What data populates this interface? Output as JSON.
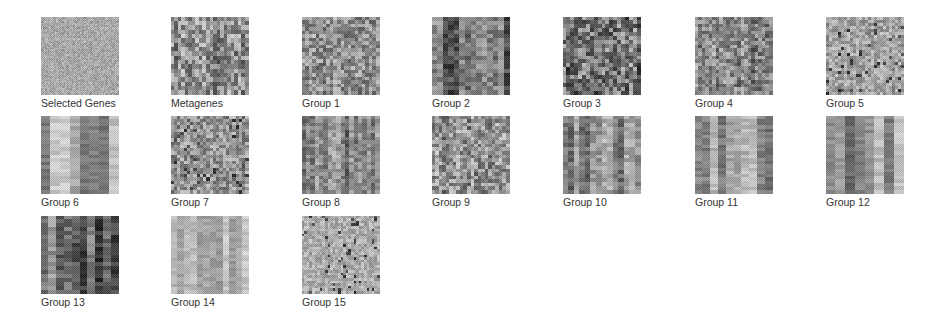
{
  "figure": {
    "title": "",
    "background": "#ffffff",
    "label_color": "#333333"
  },
  "chart_data": {
    "type": "heatmap",
    "title": "",
    "layout": {
      "rows": 3,
      "columns": 7,
      "panel_size_px": 78
    },
    "colormap": "grayscale",
    "panels": [
      {
        "name": "Selected Genes",
        "row": 0,
        "col": 0,
        "style": "fine-noise",
        "cells": [
          64,
          64
        ],
        "mean": 0.66,
        "contrast": 0.1,
        "bar_strength": 0.0
      },
      {
        "name": "Metagenes",
        "row": 0,
        "col": 1,
        "style": "blocky",
        "cells": [
          18,
          22
        ],
        "mean": 0.55,
        "contrast": 0.32,
        "bar_strength": 0.3
      },
      {
        "name": "Group 1",
        "row": 0,
        "col": 2,
        "style": "blocky",
        "cells": [
          22,
          22
        ],
        "mean": 0.56,
        "contrast": 0.25,
        "bar_strength": 0.15
      },
      {
        "name": "Group 2",
        "row": 0,
        "col": 3,
        "style": "blocky-bars",
        "cells": [
          18,
          14
        ],
        "mean": 0.45,
        "contrast": 0.32,
        "bar_strength": 0.5
      },
      {
        "name": "Group 3",
        "row": 0,
        "col": 4,
        "style": "blocky",
        "cells": [
          20,
          20
        ],
        "mean": 0.45,
        "contrast": 0.34,
        "bar_strength": 0.2
      },
      {
        "name": "Group 4",
        "row": 0,
        "col": 5,
        "style": "blocky",
        "cells": [
          22,
          22
        ],
        "mean": 0.52,
        "contrast": 0.28,
        "bar_strength": 0.3
      },
      {
        "name": "Group 5",
        "row": 0,
        "col": 6,
        "style": "speckled",
        "cells": [
          26,
          26
        ],
        "mean": 0.64,
        "contrast": 0.18,
        "bar_strength": 0.15
      },
      {
        "name": "Group 6",
        "row": 1,
        "col": 0,
        "style": "vertical-bars",
        "cells": [
          22,
          8
        ],
        "mean": 0.62,
        "contrast": 0.25,
        "bar_strength": 0.7
      },
      {
        "name": "Group 7",
        "row": 1,
        "col": 1,
        "style": "speckled",
        "cells": [
          24,
          24
        ],
        "mean": 0.58,
        "contrast": 0.22,
        "bar_strength": 0.1
      },
      {
        "name": "Group 8",
        "row": 1,
        "col": 2,
        "style": "blocky-bars",
        "cells": [
          22,
          18
        ],
        "mean": 0.52,
        "contrast": 0.28,
        "bar_strength": 0.5
      },
      {
        "name": "Group 9",
        "row": 1,
        "col": 3,
        "style": "blocky",
        "cells": [
          22,
          22
        ],
        "mean": 0.58,
        "contrast": 0.28,
        "bar_strength": 0.2
      },
      {
        "name": "Group 10",
        "row": 1,
        "col": 4,
        "style": "blocky-bars",
        "cells": [
          20,
          14
        ],
        "mean": 0.55,
        "contrast": 0.28,
        "bar_strength": 0.55
      },
      {
        "name": "Group 11",
        "row": 1,
        "col": 5,
        "style": "vertical-bars",
        "cells": [
          24,
          10
        ],
        "mean": 0.55,
        "contrast": 0.27,
        "bar_strength": 0.65
      },
      {
        "name": "Group 12",
        "row": 1,
        "col": 6,
        "style": "vertical-bars",
        "cells": [
          22,
          8
        ],
        "mean": 0.55,
        "contrast": 0.3,
        "bar_strength": 0.75
      },
      {
        "name": "Group 13",
        "row": 2,
        "col": 0,
        "style": "vertical-bars",
        "cells": [
          20,
          10
        ],
        "mean": 0.42,
        "contrast": 0.32,
        "bar_strength": 0.6
      },
      {
        "name": "Group 14",
        "row": 2,
        "col": 1,
        "style": "vertical-bars",
        "cells": [
          24,
          12
        ],
        "mean": 0.7,
        "contrast": 0.16,
        "bar_strength": 0.55
      },
      {
        "name": "Group 15",
        "row": 2,
        "col": 2,
        "style": "speckled",
        "cells": [
          30,
          30
        ],
        "mean": 0.68,
        "contrast": 0.13,
        "bar_strength": 0.0
      }
    ]
  },
  "panels": [
    {
      "label": "Selected Genes",
      "x": 41,
      "y": 17
    },
    {
      "label": "Metagenes",
      "x": 171,
      "y": 17
    },
    {
      "label": "Group 1",
      "x": 302,
      "y": 17
    },
    {
      "label": "Group 2",
      "x": 432,
      "y": 17
    },
    {
      "label": "Group 3",
      "x": 563,
      "y": 17
    },
    {
      "label": "Group 4",
      "x": 695,
      "y": 17
    },
    {
      "label": "Group 5",
      "x": 826,
      "y": 17
    },
    {
      "label": "Group 6",
      "x": 41,
      "y": 116
    },
    {
      "label": "Group 7",
      "x": 171,
      "y": 116
    },
    {
      "label": "Group 8",
      "x": 302,
      "y": 116
    },
    {
      "label": "Group 9",
      "x": 432,
      "y": 116
    },
    {
      "label": "Group 10",
      "x": 563,
      "y": 116
    },
    {
      "label": "Group 11",
      "x": 695,
      "y": 116
    },
    {
      "label": "Group 12",
      "x": 826,
      "y": 116
    },
    {
      "label": "Group 13",
      "x": 41,
      "y": 216
    },
    {
      "label": "Group 14",
      "x": 171,
      "y": 216
    },
    {
      "label": "Group 15",
      "x": 302,
      "y": 216
    }
  ]
}
